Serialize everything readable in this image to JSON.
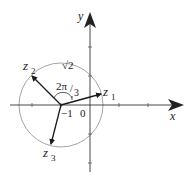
{
  "diagram": {
    "type": "complex-plane-roots",
    "axes": {
      "x_label": "x",
      "y_label": "y",
      "origin_label": "0"
    },
    "circle": {
      "center_label": "−1",
      "radius_label": "√2"
    },
    "angle_label": {
      "numerator": "2π",
      "slash": "/",
      "denominator": "3"
    },
    "points": [
      {
        "name": "z",
        "sub": "1"
      },
      {
        "name": "z",
        "sub": "2"
      },
      {
        "name": "z",
        "sub": "3"
      }
    ],
    "colors": {
      "axis": "#333333",
      "circle": "#999999",
      "vector": "#1a1a1a",
      "background": "#ffffff"
    }
  }
}
